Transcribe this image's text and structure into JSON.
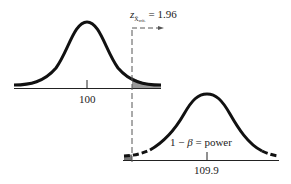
{
  "diagram": {
    "type": "power-analysis-normal-curves",
    "critical_label": {
      "symbol": "z",
      "subscript": "X̄",
      "subsubscript": "crit.",
      "equals": "=",
      "value": "1.96"
    },
    "null_distribution": {
      "mean_label": "100",
      "shaded_region": "right tail beyond critical value (alpha)"
    },
    "alternative_distribution": {
      "mean_label": "109.9",
      "power_label": {
        "prefix": "1 −",
        "beta": "β",
        "suffix": "= power"
      }
    },
    "colors": {
      "curve": "#111111",
      "axis": "#222222",
      "shade": "#9a9a9a",
      "dashed_line": "#555555",
      "background": "#ffffff"
    }
  }
}
